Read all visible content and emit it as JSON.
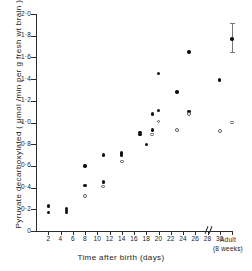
{
  "chart_data": {
    "type": "scatter",
    "title": "",
    "xlabel": "Time after birth (days)",
    "ylabel": "Pyruvate decarboxylated ( μmol /min per g fresh wt brain )",
    "xlim": [
      0,
      32
    ],
    "ylim": [
      0,
      2.0
    ],
    "grid": false,
    "legend": "none",
    "x_ticks": [
      2,
      4,
      6,
      8,
      10,
      12,
      14,
      16,
      18,
      20,
      22,
      24,
      26,
      28,
      30
    ],
    "x_tick_labels": [
      "2",
      "4",
      "6",
      "8",
      "10",
      "12",
      "14",
      "16",
      "18",
      "20",
      "22",
      "24",
      "26",
      "28",
      "30"
    ],
    "x_break_after": 30,
    "x_extra_category": {
      "label_line1": "Adult",
      "label_line2": "(8 weeks)",
      "x": 32
    },
    "y_ticks": [
      0,
      0.2,
      0.4,
      0.6,
      0.8,
      1.0,
      1.2,
      1.4,
      1.6,
      1.8,
      2.0
    ],
    "y_tick_labels": [
      "0",
      "0·2",
      "0·4",
      "0·6",
      "0·8",
      "1·0",
      "1·2",
      "1·4",
      "1·6",
      "1·8",
      "2·0"
    ],
    "series": [
      {
        "name": "filled-circles",
        "marker": "filled circle",
        "color": "#111111",
        "points": [
          {
            "x": 2,
            "y": 0.23
          },
          {
            "x": 2,
            "y": 0.17
          },
          {
            "x": 5,
            "y": 0.21
          },
          {
            "x": 5,
            "y": 0.19
          },
          {
            "x": 5,
            "y": 0.17
          },
          {
            "x": 8,
            "y": 0.6
          },
          {
            "x": 8,
            "y": 0.42
          },
          {
            "x": 11,
            "y": 0.7
          },
          {
            "x": 11,
            "y": 0.45
          },
          {
            "x": 14,
            "y": 0.72
          },
          {
            "x": 14,
            "y": 0.7
          },
          {
            "x": 17,
            "y": 0.91
          },
          {
            "x": 17,
            "y": 0.89
          },
          {
            "x": 18,
            "y": 0.8
          },
          {
            "x": 19,
            "y": 1.08
          },
          {
            "x": 19,
            "y": 0.93
          },
          {
            "x": 20,
            "y": 1.45
          },
          {
            "x": 20,
            "y": 1.11
          },
          {
            "x": 23,
            "y": 1.28
          },
          {
            "x": 25,
            "y": 1.65
          },
          {
            "x": 25,
            "y": 1.1
          },
          {
            "x": 30,
            "y": 1.39
          },
          {
            "x": 32,
            "y": 1.77,
            "error_low": 1.65,
            "error_high": 1.92
          }
        ]
      },
      {
        "name": "open-circles",
        "marker": "open circle",
        "color": "#555555",
        "points": [
          {
            "x": 8,
            "y": 0.32
          },
          {
            "x": 11,
            "y": 0.41
          },
          {
            "x": 14,
            "y": 0.64
          },
          {
            "x": 19,
            "y": 0.89
          },
          {
            "x": 20,
            "y": 1.01
          },
          {
            "x": 23,
            "y": 0.93
          },
          {
            "x": 25,
            "y": 1.08
          },
          {
            "x": 30,
            "y": 0.92
          },
          {
            "x": 32,
            "y": 1.0
          }
        ]
      }
    ]
  }
}
